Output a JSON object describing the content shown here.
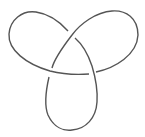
{
  "diagram": {
    "type": "knot-diagram",
    "knot": "trefoil",
    "crossings": 3,
    "colors": {
      "stroke": "#555555",
      "background": "#ffffff"
    }
  }
}
